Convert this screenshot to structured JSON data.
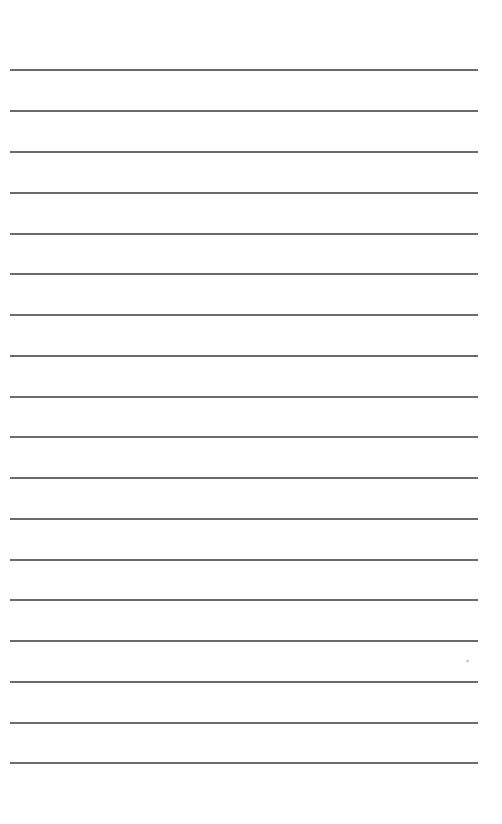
{
  "page": {
    "type": "lined-paper",
    "background_color": "#ffffff",
    "line_color": "#5a5a5a",
    "line_count": 18,
    "line_left": 10,
    "line_right": 478,
    "line_positions": [
      70,
      111,
      152,
      193,
      234,
      274,
      315,
      356,
      397,
      437,
      478,
      519,
      560,
      600,
      641,
      682,
      723,
      763
    ]
  }
}
